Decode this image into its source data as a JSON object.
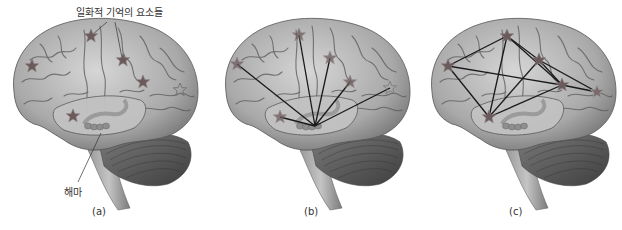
{
  "figure": {
    "annotations": {
      "episodic_elements": "일화적 기억의 요소들",
      "hippocampus": "해마"
    },
    "panels": [
      {
        "id": "a",
        "label": "(a)",
        "x_center": 100
      },
      {
        "id": "b",
        "label": "(b)",
        "x_center": 312
      },
      {
        "id": "c",
        "label": "(c)",
        "x_center": 516
      }
    ],
    "colors": {
      "brain_fill": "#b8b8b8",
      "brain_dark": "#6e6e6e",
      "cerebellum": "#5a5a5a",
      "star": "#6b5a5c",
      "star_outline": "#8a7a7c",
      "line": "#1a1a1a"
    }
  }
}
